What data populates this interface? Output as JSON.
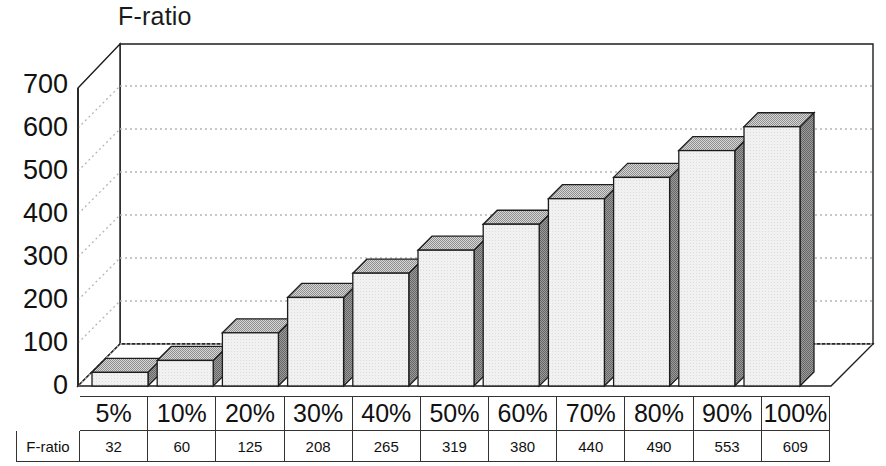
{
  "chart_data": {
    "type": "bar",
    "title": "F-ratio",
    "xlabel": "",
    "ylabel": "F-ratio",
    "categories": [
      "5%",
      "10%",
      "20%",
      "30%",
      "40%",
      "50%",
      "60%",
      "70%",
      "80%",
      "90%",
      "100%"
    ],
    "values": [
      32,
      60,
      125,
      208,
      265,
      319,
      380,
      440,
      490,
      553,
      609
    ],
    "series": [
      {
        "name": "F-ratio",
        "values": [
          32,
          60,
          125,
          208,
          265,
          319,
          380,
          440,
          490,
          553,
          609
        ]
      }
    ],
    "ylim": [
      0,
      700
    ],
    "yticks": [
      0,
      100,
      200,
      300,
      400,
      500,
      600,
      700
    ],
    "ytick_labels": [
      "0",
      "100",
      "200",
      "300",
      "400",
      "500",
      "600",
      "700"
    ],
    "grid": true,
    "grid_style": "dotted-horizontal",
    "legend": false,
    "legend_position": "none",
    "three_d": true,
    "colors": {
      "bar_front": "#ededed",
      "bar_top": "#b9b9b9",
      "bar_side": "#868686",
      "outline": "#1d1d1d",
      "gridline": "#b5b5b5",
      "background": "#ffffff"
    }
  },
  "table": {
    "row_header": "F-ratio",
    "columns": [
      "5%",
      "10%",
      "20%",
      "30%",
      "40%",
      "50%",
      "60%",
      "70%",
      "80%",
      "90%",
      "100%"
    ],
    "values": [
      "32",
      "60",
      "125",
      "208",
      "265",
      "319",
      "380",
      "440",
      "490",
      "553",
      "609"
    ]
  }
}
